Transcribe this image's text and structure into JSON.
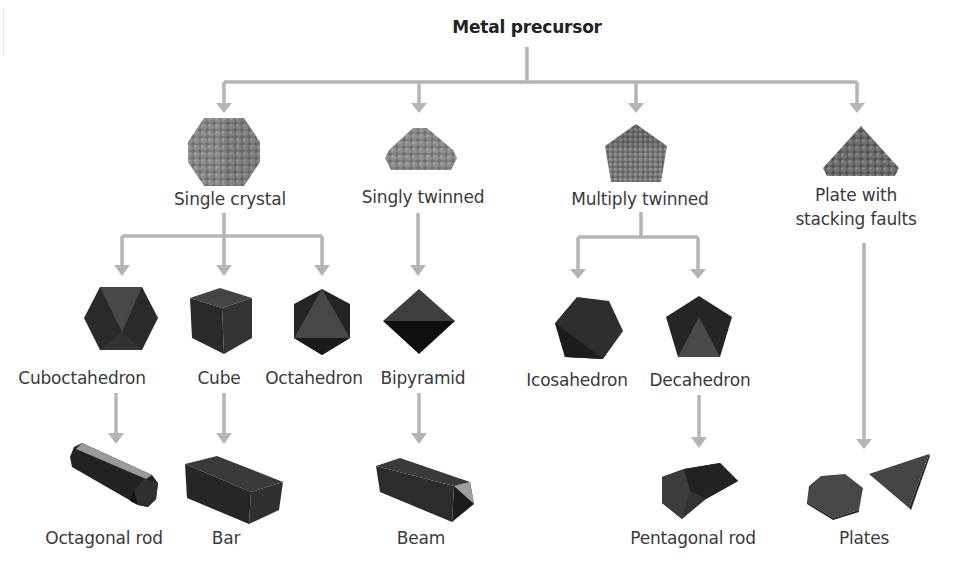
{
  "title": "Metal precursor",
  "colors": {
    "arrow": "#b5b5b5",
    "solid_dark": "#2b2b2b",
    "solid_mid": "#4a4a4a",
    "atom_gray": "#7a7a7a",
    "text": "#3a3a3a"
  },
  "level1": [
    {
      "label": "Single crystal",
      "icon": "cuboctahedral-cluster-icon"
    },
    {
      "label": "Singly twinned",
      "icon": "twinned-cluster-icon"
    },
    {
      "label": "Multiply twinned",
      "icon": "pentagonal-cluster-icon"
    },
    {
      "label_line1": "Plate with",
      "label_line2": "stacking faults",
      "icon": "triangular-cluster-icon"
    }
  ],
  "level2": [
    {
      "label": "Cuboctahedron",
      "icon": "cuboctahedron-icon"
    },
    {
      "label": "Cube",
      "icon": "cube-icon"
    },
    {
      "label": "Octahedron",
      "icon": "octahedron-icon"
    },
    {
      "label": "Bipyramid",
      "icon": "bipyramid-icon"
    },
    {
      "label": "Icosahedron",
      "icon": "icosahedron-icon"
    },
    {
      "label": "Decahedron",
      "icon": "decahedron-icon"
    }
  ],
  "level3": [
    {
      "label": "Octagonal rod",
      "icon": "octagonal-rod-icon"
    },
    {
      "label": "Bar",
      "icon": "bar-icon"
    },
    {
      "label": "Beam",
      "icon": "beam-icon"
    },
    {
      "label": "Pentagonal rod",
      "icon": "pentagonal-rod-icon"
    },
    {
      "label": "Plates",
      "icon": "plates-icon"
    }
  ]
}
